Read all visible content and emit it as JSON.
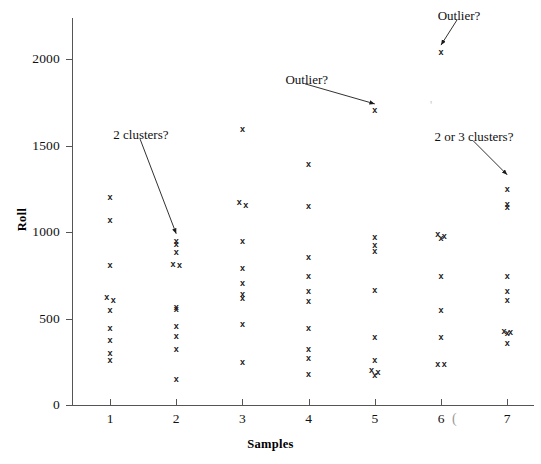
{
  "figure": {
    "background_color": "#ffffff",
    "ink_color": "#1a1a1a",
    "axis_color": "#555555"
  },
  "axes": {
    "y_title": "Roll",
    "x_title": "Samples",
    "y_ticks": [
      "2000",
      "1500",
      "1000",
      "500",
      "0"
    ],
    "x_ticks": [
      "1",
      "2",
      "3",
      "4",
      "5",
      "6",
      "7"
    ],
    "stray_mark": "("
  },
  "annotations": [
    {
      "id": "ann-2-clusters",
      "text": "2 clusters?"
    },
    {
      "id": "ann-outlier-middle",
      "text": "Outlier?"
    },
    {
      "id": "ann-outlier-top",
      "text": "Outlier?"
    },
    {
      "id": "ann-2-or-3-clusters",
      "text": "2 or 3 clusters?"
    }
  ],
  "chart_data": {
    "type": "scatter",
    "title": "",
    "xlabel": "Samples",
    "ylabel": "Roll",
    "xlim": [
      0.4,
      7.5
    ],
    "ylim": [
      0,
      2300
    ],
    "grid": false,
    "legend": null,
    "marker": "x",
    "series": [
      {
        "name": "Roll measurements",
        "points": [
          {
            "x": 1,
            "y": 1200
          },
          {
            "x": 1,
            "y": 1065
          },
          {
            "x": 1,
            "y": 805
          },
          {
            "x": 1,
            "y": 620
          },
          {
            "x": 1,
            "y": 605
          },
          {
            "x": 1,
            "y": 545
          },
          {
            "x": 1,
            "y": 440
          },
          {
            "x": 1,
            "y": 375
          },
          {
            "x": 1,
            "y": 300
          },
          {
            "x": 1,
            "y": 255
          },
          {
            "x": 2,
            "y": 945
          },
          {
            "x": 2,
            "y": 925
          },
          {
            "x": 2,
            "y": 880
          },
          {
            "x": 2,
            "y": 815
          },
          {
            "x": 2,
            "y": 808
          },
          {
            "x": 2,
            "y": 565
          },
          {
            "x": 2,
            "y": 550
          },
          {
            "x": 2,
            "y": 455
          },
          {
            "x": 2,
            "y": 395
          },
          {
            "x": 2,
            "y": 320
          },
          {
            "x": 2,
            "y": 150
          },
          {
            "x": 3,
            "y": 1595
          },
          {
            "x": 3,
            "y": 1170
          },
          {
            "x": 3,
            "y": 1155
          },
          {
            "x": 3,
            "y": 945
          },
          {
            "x": 3,
            "y": 790
          },
          {
            "x": 3,
            "y": 705
          },
          {
            "x": 3,
            "y": 640
          },
          {
            "x": 3,
            "y": 615
          },
          {
            "x": 3,
            "y": 465
          },
          {
            "x": 3,
            "y": 245
          },
          {
            "x": 4,
            "y": 1390
          },
          {
            "x": 4,
            "y": 1150
          },
          {
            "x": 4,
            "y": 855
          },
          {
            "x": 4,
            "y": 740
          },
          {
            "x": 4,
            "y": 655
          },
          {
            "x": 4,
            "y": 600
          },
          {
            "x": 4,
            "y": 445
          },
          {
            "x": 4,
            "y": 320
          },
          {
            "x": 4,
            "y": 270
          },
          {
            "x": 4,
            "y": 175
          },
          {
            "x": 5,
            "y": 1700
          },
          {
            "x": 5,
            "y": 970
          },
          {
            "x": 5,
            "y": 920
          },
          {
            "x": 5,
            "y": 890
          },
          {
            "x": 5,
            "y": 660
          },
          {
            "x": 5,
            "y": 390
          },
          {
            "x": 5,
            "y": 255
          },
          {
            "x": 5,
            "y": 200
          },
          {
            "x": 5,
            "y": 185
          },
          {
            "x": 5,
            "y": 170
          },
          {
            "x": 6,
            "y": 2040
          },
          {
            "x": 6,
            "y": 985
          },
          {
            "x": 6,
            "y": 975
          },
          {
            "x": 6,
            "y": 960
          },
          {
            "x": 6,
            "y": 740
          },
          {
            "x": 6,
            "y": 545
          },
          {
            "x": 6,
            "y": 390
          },
          {
            "x": 6,
            "y": 235
          },
          {
            "x": 6,
            "y": 235
          },
          {
            "x": 7,
            "y": 1245
          },
          {
            "x": 7,
            "y": 1160
          },
          {
            "x": 7,
            "y": 1140
          },
          {
            "x": 7,
            "y": 740
          },
          {
            "x": 7,
            "y": 655
          },
          {
            "x": 7,
            "y": 605
          },
          {
            "x": 7,
            "y": 425
          },
          {
            "x": 7,
            "y": 420
          },
          {
            "x": 7,
            "y": 415
          },
          {
            "x": 7,
            "y": 355
          }
        ]
      }
    ],
    "annotations": [
      {
        "text": "2 clusters?",
        "label_x": 1.05,
        "label_y": 1560,
        "point_x": 2.0,
        "point_y": 950
      },
      {
        "text": "Outlier?",
        "label_x": 3.65,
        "label_y": 1880,
        "point_x": 5.0,
        "point_y": 1700
      },
      {
        "text": "Outlier?",
        "label_x": 5.95,
        "label_y": 2250,
        "point_x": 6.0,
        "point_y": 2040
      },
      {
        "text": "2 or 3 clusters?",
        "label_x": 5.9,
        "label_y": 1550,
        "point_x": 7.0,
        "point_y": 1290
      }
    ]
  }
}
